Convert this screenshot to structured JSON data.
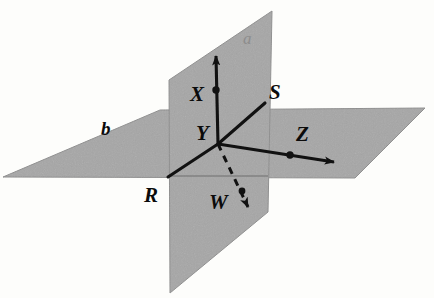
{
  "figure": {
    "background_color": "#fdfdfb",
    "plane_fill": "#a6a6a6",
    "plane_stroke": "#8f8f8f",
    "line_color": "#111111"
  },
  "planes": [
    {
      "id": "vertical-plane",
      "label": "a",
      "label_color": "#8d8d8d",
      "label_x": 243,
      "label_y": 30,
      "points": "169,80 272,11 268,212 170,293"
    },
    {
      "id": "horizontal-plane",
      "label": "b",
      "label_color": "#0b0b0b",
      "label_x": 101,
      "label_y": 119,
      "points": "3,177 160,110 425,108 355,178"
    }
  ],
  "rays": [
    {
      "id": "ray-up",
      "x1": 218,
      "y1": 144,
      "x2": 216,
      "y2": 56,
      "dashed": false,
      "arrow": true
    },
    {
      "id": "ray-to-s",
      "x1": 218,
      "y1": 144,
      "x2": 265,
      "y2": 103,
      "dashed": false,
      "arrow": false
    },
    {
      "id": "ray-to-z",
      "x1": 218,
      "y1": 144,
      "x2": 334,
      "y2": 162,
      "dashed": false,
      "arrow": true
    },
    {
      "id": "ray-to-w",
      "x1": 218,
      "y1": 144,
      "x2": 248,
      "y2": 207,
      "dashed": true,
      "arrow": true
    },
    {
      "id": "ray-to-r",
      "x1": 218,
      "y1": 144,
      "x2": 168,
      "y2": 177,
      "dashed": false,
      "arrow": false
    }
  ],
  "points": [
    {
      "id": "point-x",
      "label": "X",
      "dot_x": 216,
      "dot_y": 90,
      "label_x": 190,
      "label_y": 84
    },
    {
      "id": "point-y",
      "label": "Y",
      "dot_x": null,
      "dot_y": null,
      "label_x": 196,
      "label_y": 123
    },
    {
      "id": "point-s",
      "label": "S",
      "dot_x": null,
      "dot_y": null,
      "label_x": 269,
      "label_y": 82
    },
    {
      "id": "point-z",
      "label": "Z",
      "dot_x": 290,
      "dot_y": 155,
      "label_x": 296,
      "label_y": 124
    },
    {
      "id": "point-r",
      "label": "R",
      "dot_x": null,
      "dot_y": null,
      "label_x": 144,
      "label_y": 185
    },
    {
      "id": "point-w",
      "label": "W",
      "dot_x": 242,
      "dot_y": 191,
      "label_x": 209,
      "label_y": 192
    }
  ]
}
